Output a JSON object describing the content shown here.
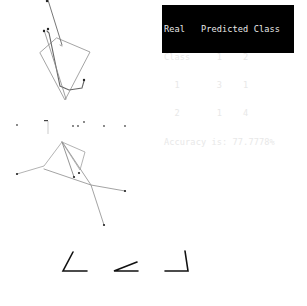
{
  "console": {
    "lines": [
      "Real   Predicted Class",
      "Class     1    2",
      "  1       3    1",
      "  2       1    4",
      "Accuracy is: 77.7778%"
    ],
    "header_real": "Real",
    "header_predicted": "Predicted Class",
    "header_class": "Class",
    "confusion_matrix": {
      "columns": [
        "1",
        "2"
      ],
      "rows": [
        {
          "label": "1",
          "values": [
            "3",
            "1"
          ]
        },
        {
          "label": "2",
          "values": [
            "1",
            "4"
          ]
        }
      ]
    },
    "accuracy_text": "Accuracy is: 77.7778%",
    "accuracy_value": "77.7778%"
  },
  "figures": {
    "stick_figure_top": {
      "color": "#777777",
      "joint_color": "#222222"
    },
    "dots_row": {
      "color": "#555555"
    },
    "stick_figure_middle": {
      "color": "#888888",
      "joint_color": "#222222"
    },
    "angle_glyphs": {
      "color": "#111111",
      "count": 3
    }
  }
}
